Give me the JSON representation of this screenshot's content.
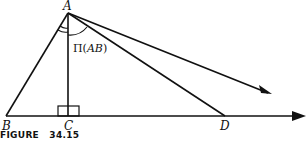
{
  "figure": {
    "caption": "FIGURE   34.15",
    "points": {
      "A": {
        "label": "A",
        "x": 68,
        "y": 13
      },
      "B": {
        "label": "B",
        "x": 6,
        "y": 116
      },
      "C": {
        "label": "C",
        "x": 68,
        "y": 116
      },
      "D": {
        "label": "D",
        "x": 225,
        "y": 116
      }
    },
    "angle_label": {
      "prefix": "Π(",
      "arg": "AB",
      "suffix": ")"
    },
    "segments": [
      {
        "from": "A",
        "to": "B"
      },
      {
        "from": "A",
        "to": "C"
      },
      {
        "from": "A",
        "to": "D"
      },
      {
        "from": "B",
        "to": "baseline-arrow",
        "arrow": true
      },
      {
        "from": "A",
        "to": "parallel-ray-arrow",
        "arrow": true
      }
    ],
    "colors": {
      "stroke": "#111111",
      "background": "#ffffff"
    }
  }
}
